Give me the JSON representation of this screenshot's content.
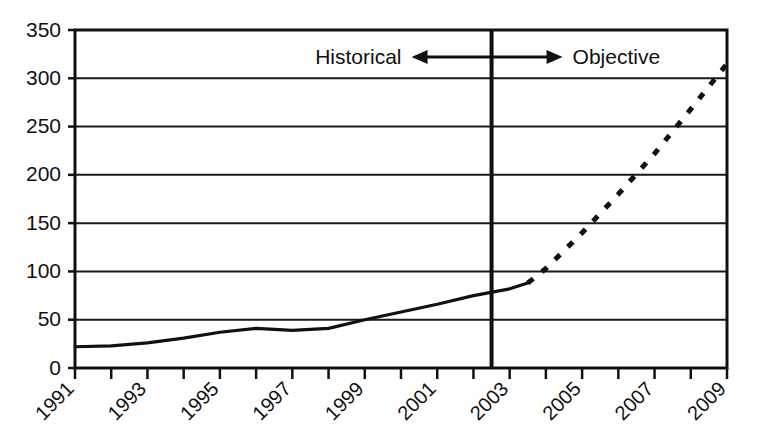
{
  "chart_data": {
    "type": "line",
    "title": "",
    "subtitle": "",
    "xlabel": "",
    "ylabel": "",
    "xlim": [
      1991,
      2009
    ],
    "ylim": [
      0,
      350
    ],
    "yticks": [
      0,
      50,
      100,
      150,
      200,
      250,
      300,
      350
    ],
    "ytick_labels": [
      "0",
      "50",
      "100",
      "150",
      "200",
      "250",
      "300",
      "350"
    ],
    "xticks": [
      1991,
      1992,
      1993,
      1994,
      1995,
      1996,
      1997,
      1998,
      1999,
      2000,
      2001,
      2002,
      2003,
      2004,
      2005,
      2006,
      2007,
      2008,
      2009
    ],
    "xtick_labels": [
      "1991",
      "",
      "1993",
      "",
      "1995",
      "",
      "1997",
      "",
      "1999",
      "",
      "2001",
      "",
      "2003",
      "",
      "2005",
      "",
      "2007",
      "",
      "2009"
    ],
    "xtick_labels_shown": [
      "1991",
      "1993",
      "1995",
      "1997",
      "1999",
      "2001",
      "2003",
      "2005",
      "2007",
      "2009"
    ],
    "grid": "horizontal",
    "legend": "none",
    "series": [
      {
        "name": "Historical",
        "style": "solid",
        "color": "#111111",
        "x": [
          1991,
          1992,
          1993,
          1994,
          1995,
          1996,
          1997,
          1998,
          1999,
          2000,
          2001,
          2002,
          2003,
          2003.5
        ],
        "values": [
          22,
          23,
          26,
          31,
          37,
          41,
          39,
          41,
          50,
          58,
          66,
          75,
          82,
          88
        ]
      },
      {
        "name": "Objective",
        "style": "dashed",
        "color": "#111111",
        "x": [
          2003.5,
          2004,
          2005,
          2006,
          2007,
          2008,
          2009
        ],
        "values": [
          88,
          103,
          140,
          180,
          222,
          268,
          315
        ]
      }
    ],
    "annotations": [
      {
        "name": "historical-label",
        "text": "Historical",
        "x": 2002.5,
        "y": 322
      },
      {
        "name": "objective-label",
        "text": "Objective",
        "x": 2003.5,
        "y": 322
      },
      {
        "name": "divider",
        "text": "",
        "x": 2002.5,
        "y": 350
      }
    ]
  },
  "annotations": {
    "historical_label": "Historical",
    "objective_label": "Objective"
  },
  "colors": {
    "axis": "#111111",
    "grid": "#1a1a1a",
    "line": "#111111",
    "background": "#ffffff"
  }
}
